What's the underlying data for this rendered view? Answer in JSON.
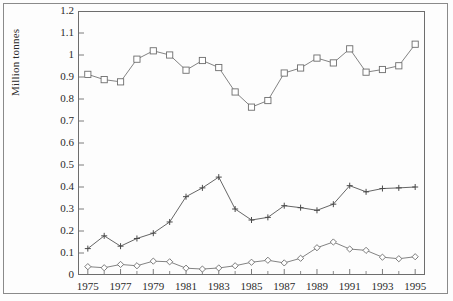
{
  "figure": {
    "background": "#fdfdfd",
    "line_color": "#6d6d6d",
    "frame_color": "#6d6d6d",
    "outer_frame_color": "#8a8a8a",
    "text_color": "#2b2b2b"
  },
  "chart_data": {
    "type": "line",
    "title": "",
    "subtitle": "",
    "xlabel": "",
    "ylabel": "Million tonnes",
    "xlim": [
      1974.4,
      1995.6
    ],
    "ylim": [
      0,
      1.2
    ],
    "grid": false,
    "legend": "none",
    "x": [
      1975,
      1976,
      1977,
      1978,
      1979,
      1980,
      1981,
      1982,
      1983,
      1984,
      1985,
      1986,
      1987,
      1988,
      1989,
      1990,
      1991,
      1992,
      1993,
      1994,
      1995
    ],
    "ytick_labels": [
      "0",
      "0.1",
      "0.2",
      "0.3",
      "0.4",
      "0.5",
      "0.6",
      "0.7",
      "0.8",
      "0.9",
      "1",
      "1.1",
      "1.2"
    ],
    "ytick_values": [
      0,
      0.1,
      0.2,
      0.3,
      0.4,
      0.5,
      0.6,
      0.7,
      0.8,
      0.9,
      1.0,
      1.1,
      1.2
    ],
    "xtick_labels": [
      "1975",
      "1977",
      "1979",
      "1981",
      "1983",
      "1985",
      "1987",
      "1989",
      "1991",
      "1993",
      "1995"
    ],
    "xtick_values": [
      1975,
      1977,
      1979,
      1981,
      1983,
      1985,
      1987,
      1989,
      1991,
      1993,
      1995
    ],
    "xtick_minor_values": [
      1976,
      1978,
      1980,
      1982,
      1984,
      1986,
      1988,
      1990,
      1992,
      1994
    ],
    "series": [
      {
        "name": "series-squares",
        "marker": "square",
        "color": "#6d6d6d",
        "values": [
          0.912,
          0.888,
          0.878,
          0.981,
          1.019,
          1.0,
          0.931,
          0.975,
          0.943,
          0.832,
          0.763,
          0.793,
          0.918,
          0.941,
          0.986,
          0.964,
          1.028,
          0.922,
          0.934,
          0.951,
          1.049
        ]
      },
      {
        "name": "series-plus",
        "marker": "plus",
        "color": "#4a4a4a",
        "values": [
          0.12,
          0.178,
          0.131,
          0.166,
          0.19,
          0.241,
          0.356,
          0.396,
          0.445,
          0.3,
          0.25,
          0.262,
          0.315,
          0.306,
          0.294,
          0.322,
          0.406,
          0.378,
          0.393,
          0.396,
          0.4
        ]
      },
      {
        "name": "series-diamonds",
        "marker": "diamond",
        "color": "#6d6d6d",
        "values": [
          0.038,
          0.033,
          0.048,
          0.042,
          0.063,
          0.06,
          0.031,
          0.027,
          0.032,
          0.042,
          0.058,
          0.067,
          0.055,
          0.076,
          0.124,
          0.15,
          0.118,
          0.112,
          0.081,
          0.074,
          0.083
        ]
      }
    ]
  }
}
